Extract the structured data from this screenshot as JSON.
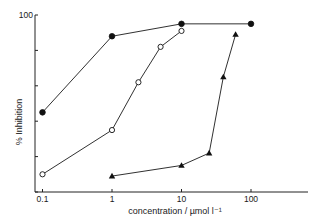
{
  "chart_data": {
    "type": "line",
    "title": "",
    "xlabel": "concentration / µmol l⁻¹",
    "ylabel": "% Inhibition",
    "xscale": "log",
    "xlim": [
      0.1,
      300
    ],
    "ylim": [
      0,
      100
    ],
    "x_ticks": [
      0.1,
      1,
      10,
      100
    ],
    "x_tick_labels": [
      "0.1",
      "1",
      "10",
      "100"
    ],
    "y_ticks": [
      0,
      20,
      40,
      60,
      80,
      100
    ],
    "y_tick_labels": [
      "",
      "",
      "",
      "",
      "",
      "100"
    ],
    "grid": false,
    "legend": null,
    "series": [
      {
        "name": "filled-circles",
        "marker": "filled-circle",
        "x": [
          0.1,
          1,
          10,
          100
        ],
        "y": [
          45,
          88,
          95,
          95
        ]
      },
      {
        "name": "open-circles",
        "marker": "open-circle",
        "x": [
          0.1,
          1,
          2.4,
          5,
          10
        ],
        "y": [
          10,
          35,
          62,
          82,
          91
        ]
      },
      {
        "name": "filled-triangles",
        "marker": "filled-triangle",
        "x": [
          1,
          10,
          25,
          40,
          60
        ],
        "y": [
          9,
          15,
          22,
          65,
          89
        ]
      }
    ]
  },
  "axes": {
    "x_title": "concentration / µmol l⁻¹",
    "y_title": "% Inhibition"
  }
}
